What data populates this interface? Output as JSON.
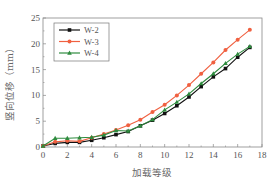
{
  "chart_data": {
    "type": "line",
    "title": "",
    "xlabel": "加载等级",
    "ylabel": "竖向位移（mm）",
    "xlim": [
      0,
      18
    ],
    "ylim": [
      0,
      25
    ],
    "xticks": [
      0,
      2,
      4,
      6,
      8,
      10,
      12,
      14,
      16,
      18
    ],
    "yticks": [
      0,
      5,
      10,
      15,
      20,
      25
    ],
    "grid": false,
    "legend_position": "upper left",
    "x": [
      0,
      1,
      2,
      3,
      4,
      5,
      6,
      7,
      8,
      9,
      10,
      11,
      12,
      13,
      14,
      15,
      16,
      17
    ],
    "series": [
      {
        "name": "W-2",
        "color": "#111111",
        "marker": "square",
        "values": [
          0.2,
          0.7,
          0.9,
          0.9,
          1.3,
          1.8,
          2.4,
          3.0,
          4.1,
          5.2,
          6.5,
          8.0,
          9.7,
          11.7,
          13.6,
          15.2,
          17.4,
          19.3
        ]
      },
      {
        "name": "W-3",
        "color": "#f06040",
        "marker": "circle",
        "values": [
          0.2,
          1.0,
          1.2,
          1.1,
          1.8,
          2.5,
          3.3,
          4.2,
          5.3,
          6.8,
          8.2,
          10.0,
          12.0,
          14.2,
          16.4,
          18.8,
          20.8,
          22.7
        ]
      },
      {
        "name": "W-4",
        "color": "#2e8b3e",
        "marker": "triangle",
        "values": [
          0.2,
          1.7,
          1.7,
          1.8,
          1.9,
          2.3,
          3.2,
          3.1,
          4.1,
          5.3,
          7.2,
          8.7,
          10.3,
          12.3,
          14.2,
          16.2,
          18.0,
          19.5
        ]
      }
    ]
  }
}
